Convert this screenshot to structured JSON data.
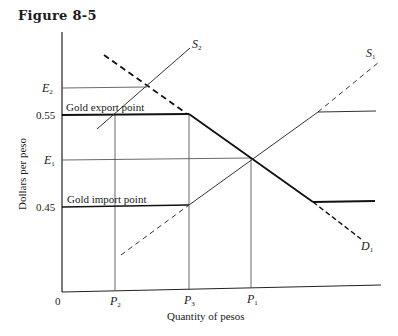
{
  "figure": {
    "title": "Figure 8-5",
    "x_axis_label": "Quantity of pesos",
    "y_axis_label": "Dollars per peso",
    "origin_label": "0",
    "y_ticks": [
      {
        "label": "E",
        "sub": "2"
      },
      {
        "label": "0.55"
      },
      {
        "label": "E",
        "sub": "1"
      },
      {
        "label": "0.45"
      }
    ],
    "x_ticks": [
      {
        "label": "P",
        "sub": "2"
      },
      {
        "label": "P",
        "sub": "3"
      },
      {
        "label": "P",
        "sub": "1"
      }
    ],
    "annotations": {
      "gold_export": "Gold export point",
      "gold_import": "Gold import point"
    },
    "curves": {
      "s2": {
        "label": "S",
        "sub": "2"
      },
      "s1": {
        "label": "S",
        "sub": "1"
      },
      "d1": {
        "label": "D",
        "sub": "1"
      }
    }
  }
}
